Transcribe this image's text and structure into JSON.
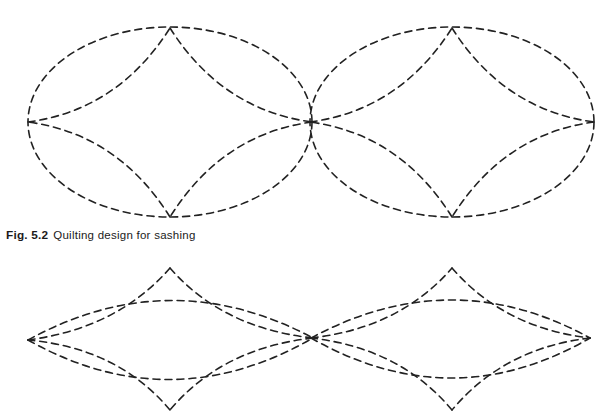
{
  "page": {
    "background_color": "#ffffff",
    "width": 615,
    "height": 415
  },
  "caption": {
    "label": "Fig. 5.2",
    "text": "Quilting design for sashing",
    "full": "Fig. 5.2 Quilting design for sashing",
    "color": "#1b1b1b"
  },
  "drawing": {
    "stroke_color": "#222222",
    "stroke_width": 1.6,
    "dash_pattern": "7 5",
    "line_style": "dashed",
    "description": "Repeating quilting motif: elongated oval medallions each enclosing a concave-sided four-pointed star, joined point-to-point along a horizontal band.",
    "rows": [
      {
        "name": "upper-band",
        "motif_shape": "ellipse",
        "center_y": 122,
        "radius_x": 142,
        "radius_y": 95,
        "motif_centers_x": [
          170,
          452
        ],
        "motif_count": 2,
        "junction_points_x": [
          28,
          313,
          594
        ],
        "star_cusps": {
          "top_y": 28,
          "bottom_y": 217,
          "left_right_y": 122
        }
      },
      {
        "name": "lower-band",
        "motif_shape": "lens",
        "center_y": 338,
        "radius_x": 142,
        "radius_y": 72,
        "motif_centers_x": [
          170,
          452
        ],
        "motif_count": 2,
        "junction_points_x": [
          28,
          313,
          590
        ],
        "star_cusps": {
          "top_y": 268,
          "bottom_y": 410,
          "left_right_y": 338
        },
        "clipped_at_bottom": true
      }
    ]
  }
}
